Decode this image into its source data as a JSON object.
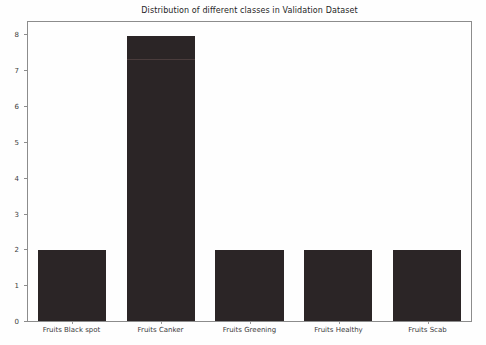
{
  "chart_data": {
    "type": "bar",
    "title": "Distribution of different classes in Validation Dataset",
    "categories": [
      "Fruits Black spot",
      "Fruits Canker",
      "Fruits Greening",
      "Fruits Healthy",
      "Fruits Scab"
    ],
    "values": [
      2,
      8,
      2,
      2,
      2
    ],
    "xlabel": "",
    "ylabel": "",
    "ylim": [
      0,
      8.4
    ],
    "yticks": [
      0,
      1,
      2,
      3,
      4,
      5,
      6,
      7,
      8
    ],
    "grid": false,
    "legend": null,
    "bar_width_fraction": 0.77,
    "bar_inner_line": {
      "bar_index": 1,
      "value": 7.33
    }
  },
  "colors": {
    "background": "#fefefe",
    "bar": "#2b2526",
    "bar_inner_line": "#4a3c3c",
    "spine": "#8c8c8c",
    "tick_text": "#3c3c3c",
    "title_text": "#252525"
  }
}
